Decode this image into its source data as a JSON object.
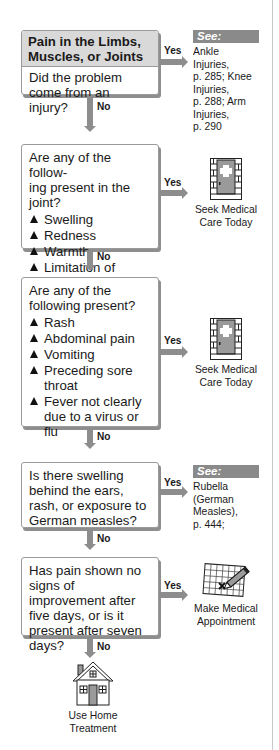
{
  "start": {
    "title": "Pain in the Limbs, Muscles, or Joints",
    "question": "Did the problem come from an injury?",
    "yes_label": "Yes",
    "no_label": "No",
    "see": {
      "tag": "See:",
      "lines": [
        "Ankle",
        "Injuries,",
        "p. 285; Knee",
        "Injuries,",
        "p. 288; Arm",
        "Injuries,",
        "p. 290"
      ]
    }
  },
  "q2": {
    "question": "Are any of the following present in the joint?",
    "question_lines": [
      "Are any of the follow-",
      "ing present in the joint?"
    ],
    "items": [
      "Swelling",
      "Redness",
      "Warmth",
      "Limitation of motion"
    ],
    "yes_label": "Yes",
    "no_label": "No",
    "outcome": {
      "icon": "medical-door-icon",
      "lines": [
        "Seek Medical",
        "Care Today"
      ]
    }
  },
  "q3": {
    "question_lines": [
      "Are any of the",
      "following present?"
    ],
    "items": [
      "Rash",
      "Abdominal pain",
      "Vomiting",
      "Preceding sore throat",
      "Fever not clearly due to a virus or flu"
    ],
    "yes_label": "Yes",
    "no_label": "No",
    "outcome": {
      "icon": "medical-door-icon",
      "lines": [
        "Seek Medical",
        "Care Today"
      ]
    }
  },
  "q4": {
    "question": "Is there swelling behind the ears, rash, or exposure to German measles?",
    "yes_label": "Yes",
    "no_label": "No",
    "see": {
      "tag": "See:",
      "lines": [
        "Rubella",
        "(German",
        "Measles),",
        "p. 444;"
      ]
    }
  },
  "q5": {
    "question": "Has pain shown no signs of improvement after five days, or is it present after seven days?",
    "yes_label": "Yes",
    "no_label": "No",
    "outcome": {
      "icon": "calendar-pencil-icon",
      "lines": [
        "Make Medical",
        "Appointment"
      ]
    }
  },
  "final": {
    "icon": "house-icon",
    "lines": [
      "Use Home",
      "Treatment"
    ]
  },
  "colors": {
    "connector": "#8d8d8d",
    "header_bg": "#d9d9d9",
    "see_tag_bg": "#8a8a8a"
  }
}
